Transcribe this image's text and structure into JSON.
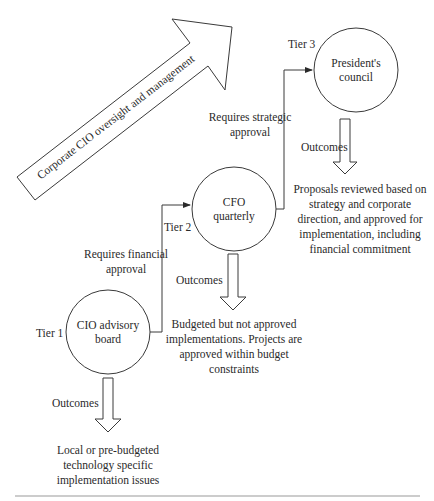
{
  "diagram": {
    "banner_arrow": {
      "label": "Corporate CIO oversight and management",
      "direction": "up-right"
    },
    "tiers": [
      {
        "tier_label": "Tier 1",
        "node": [
          "CIO advisory",
          "board"
        ],
        "outcomes_label": "Outcomes",
        "outcome_text": [
          "Local or pre-budgeted",
          "technology specific",
          "implementation issues"
        ]
      },
      {
        "tier_label": "Tier 2",
        "node": [
          "CFO",
          "quarterly"
        ],
        "outcomes_label": "Outcomes",
        "outcome_text": [
          "Budgeted but not approved",
          "implementations. Projects are",
          "approved within budget",
          "constraints"
        ]
      },
      {
        "tier_label": "Tier 3",
        "node": [
          "President's",
          "council"
        ],
        "outcomes_label": "Outcomes",
        "outcome_text": [
          "Proposals reviewed based on",
          "strategy and corporate",
          "direction, and approved for",
          "implementation, including",
          "financial commitment"
        ]
      }
    ],
    "connectors": [
      {
        "from": "Tier 1",
        "to": "Tier 2",
        "label": [
          "Requires financial",
          "approval"
        ]
      },
      {
        "from": "Tier 2",
        "to": "Tier 3",
        "label": [
          "Requires strategic",
          "approval"
        ]
      }
    ],
    "colors": {
      "stroke": "#3a3a3a",
      "text": "#2a2a2a",
      "rule": "#9a9a9a"
    }
  }
}
